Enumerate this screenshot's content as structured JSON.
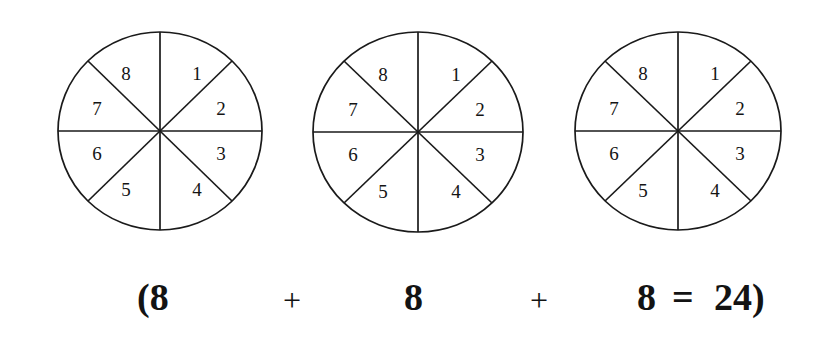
{
  "figure": {
    "kind": "pie-fraction-diagram",
    "sector_count": 8,
    "sector_labels": [
      "1",
      "2",
      "3",
      "4",
      "5",
      "6",
      "7",
      "8"
    ],
    "stroke_color": "#1a1a1a",
    "fill_color": "#ffffff",
    "background_color": "#ffffff",
    "circles": [
      {
        "name": "circle-one",
        "left": 58,
        "width": 210,
        "height": 204,
        "labels": [
          "1",
          "2",
          "3",
          "4",
          "5",
          "6",
          "7",
          "8"
        ]
      },
      {
        "name": "circle-two",
        "left": 313,
        "width": 217,
        "height": 206,
        "labels": [
          "1",
          "2",
          "3",
          "4",
          "5",
          "6",
          "7",
          "8"
        ]
      },
      {
        "name": "circle-three",
        "left": 575,
        "width": 212,
        "height": 204,
        "labels": [
          "1",
          "2",
          "3",
          "4",
          "5",
          "6",
          "7",
          "8"
        ]
      }
    ]
  },
  "equation": {
    "full_text": "(8 + 8 + 8 = 24)",
    "tokens": [
      {
        "name": "open-paren-eight",
        "text": "(8",
        "left": 137,
        "top": 16,
        "size": "big"
      },
      {
        "name": "plus-first",
        "text": "+",
        "left": 283,
        "top": 22,
        "size": "plus"
      },
      {
        "name": "addend-second",
        "text": "8",
        "left": 404,
        "top": 16,
        "size": "big"
      },
      {
        "name": "plus-second",
        "text": "+",
        "left": 530,
        "top": 22,
        "size": "plus"
      },
      {
        "name": "addend-third",
        "text": "8",
        "left": 637,
        "top": 16,
        "size": "big"
      },
      {
        "name": "equals-sign",
        "text": "=",
        "left": 672,
        "top": 16,
        "size": "big"
      },
      {
        "name": "sum-result",
        "text": "24)",
        "left": 714,
        "top": 16,
        "size": "big"
      }
    ]
  }
}
